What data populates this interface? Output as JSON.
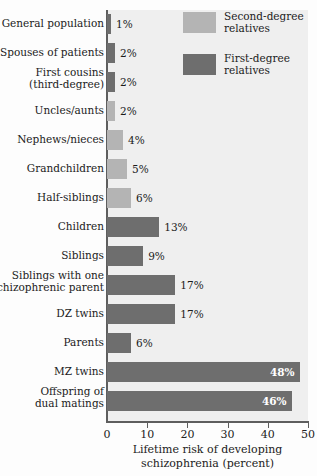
{
  "chart_data": {
    "type": "bar",
    "orientation": "horizontal",
    "title": "",
    "xlabel": "Lifetime risk of developing\nschizophrenia (percent)",
    "ylabel": "",
    "xlim": [
      0,
      50
    ],
    "xticks": [
      0,
      10,
      20,
      30,
      40,
      50
    ],
    "xtick_labels": [
      "0",
      "10",
      "20",
      "30",
      "40",
      "50"
    ],
    "grid": false,
    "legend_position": "top-right",
    "legend": [
      {
        "label": "Second-degree\nrelatives",
        "color": "#b4b4b4",
        "key": "second"
      },
      {
        "label": "First-degree\nrelatives",
        "color": "#6e6e6e",
        "key": "first"
      }
    ],
    "value_suffix": "%",
    "categories": [
      "General population",
      "Spouses of patients",
      "First cousins\n(third-degree)",
      "Uncles/aunts",
      "Nephews/nieces",
      "Grandchildren",
      "Half-siblings",
      "Children",
      "Siblings",
      "Siblings with one\nschizophrenic parent",
      "DZ twins",
      "Parents",
      "MZ twins",
      "Offspring of\ndual matings"
    ],
    "values": [
      1,
      2,
      2,
      2,
      4,
      5,
      6,
      13,
      9,
      17,
      17,
      6,
      48,
      46
    ],
    "value_labels": [
      "1%",
      "2%",
      "2%",
      "2%",
      "4%",
      "5%",
      "6%",
      "13%",
      "9%",
      "17%",
      "17%",
      "6%",
      "48%",
      "46%"
    ],
    "series_of_bar": [
      "first",
      "first",
      "first",
      "second",
      "second",
      "second",
      "second",
      "first",
      "first",
      "first",
      "first",
      "first",
      "first",
      "first"
    ],
    "label_placement": [
      "outside",
      "outside",
      "outside",
      "outside",
      "outside",
      "outside",
      "outside",
      "outside",
      "outside",
      "outside",
      "outside",
      "outside",
      "inside",
      "inside"
    ]
  }
}
